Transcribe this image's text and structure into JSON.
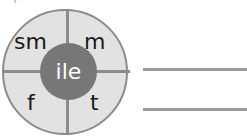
{
  "diagram": {
    "type": "quadrant-circle",
    "center": {
      "label": "ile",
      "fill_color": "#777777",
      "text_color": "#ffffff"
    },
    "outer": {
      "fill_color": "#e2e2e2",
      "stroke_color": "#8c8c8c"
    },
    "quadrants": [
      {
        "position": "top-left",
        "label": "sm"
      },
      {
        "position": "top-right",
        "label": "m"
      },
      {
        "position": "bottom-left",
        "label": "f"
      },
      {
        "position": "bottom-right",
        "label": "t"
      }
    ]
  },
  "rules": [
    {
      "name": "upper-rule",
      "color": "#9a9a9a"
    },
    {
      "name": "lower-rule",
      "color": "#9a9a9a"
    }
  ],
  "artifact": {
    "top_fragment": "p"
  }
}
